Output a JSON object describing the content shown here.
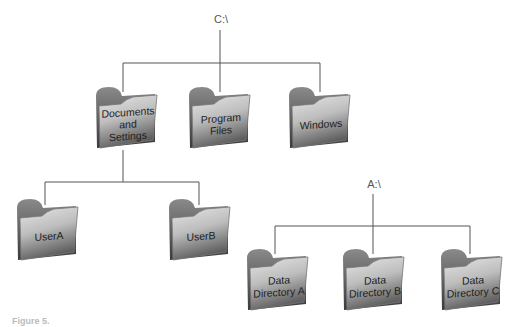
{
  "tree_c": {
    "root_label": "C:\\",
    "folders": [
      {
        "label": "Documents and Settings"
      },
      {
        "label": "Program Files"
      },
      {
        "label": "Windows"
      }
    ],
    "subfolders": [
      {
        "label": "UserA"
      },
      {
        "label": "UserB"
      }
    ]
  },
  "tree_a": {
    "root_label": "A:\\",
    "folders": [
      {
        "label": "Data Directory A"
      },
      {
        "label": "Data Directory B"
      },
      {
        "label": "Data Directory C"
      }
    ]
  },
  "caption": "Figure 5.",
  "colors": {
    "line": "#555555",
    "folder_dark": "#5a5a5a",
    "folder_light": "#d8d8d8"
  }
}
